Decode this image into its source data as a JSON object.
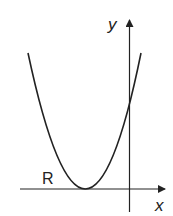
{
  "figure": {
    "colors": {
      "stroke": "#222222",
      "background": "#ffffff"
    },
    "axes": {
      "x_label": "x",
      "y_label": "y"
    },
    "region_label": "R",
    "curve": {
      "type": "parabola",
      "opens": "up",
      "vertex_on_x_axis": true,
      "vertex_side": "negative x",
      "y_intercept_side": "positive y"
    }
  }
}
